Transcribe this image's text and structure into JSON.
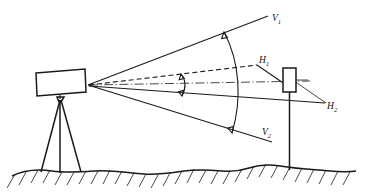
{
  "figure": {
    "kind": "technical-line-drawing",
    "width": 369,
    "height": 195,
    "background_color": "#ffffff",
    "line_color": "#1a1a1a"
  },
  "labels": {
    "v1": {
      "base": "V",
      "subscript": "1",
      "x": 272,
      "y": 21
    },
    "v2": {
      "base": "V",
      "subscript": "2",
      "x": 262,
      "y": 135
    },
    "h1": {
      "base": "H",
      "subscript": "1",
      "x": 259,
      "y": 63
    },
    "h2": {
      "base": "H",
      "subscript": "2",
      "x": 327,
      "y": 109
    }
  },
  "elements": {
    "instrument_label": "theodolite-body",
    "tripod_label": "tripod",
    "target_label": "target-board",
    "pole_label": "target-pole",
    "ground_label": "ground-surface",
    "vertex_label": "instrument-vertex"
  },
  "geometry": {
    "vertex": {
      "x": 88,
      "y": 85
    },
    "instrument_box": {
      "x": 36,
      "y": 70,
      "w": 49,
      "h": 25
    },
    "target_box": {
      "x": 283,
      "y": 68,
      "w": 13,
      "h": 24
    },
    "ground_y": 171
  }
}
